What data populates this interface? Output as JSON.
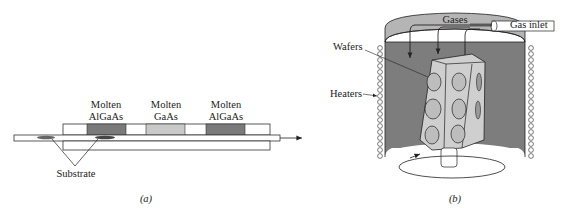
{
  "figure_a": {
    "caption": "(a)",
    "melts": [
      {
        "line1": "Molten",
        "line2": "AlGaAs",
        "color": "#7a7a7a"
      },
      {
        "line1": "Molten",
        "line2": "GaAs",
        "color": "#c9c9c9"
      },
      {
        "line1": "Molten",
        "line2": "AlGaAs",
        "color": "#7a7a7a"
      }
    ],
    "substrate_label": "Substrate"
  },
  "figure_b": {
    "caption": "(b)",
    "labels": {
      "gases": "Gases",
      "gas_inlet": "Gas inlet",
      "wafers": "Wafers",
      "heaters": "Heaters"
    },
    "colors": {
      "chamber": "#7d7d7d",
      "wafer_holder": "#cfcfcf",
      "lid": "#b5b5b5"
    }
  }
}
